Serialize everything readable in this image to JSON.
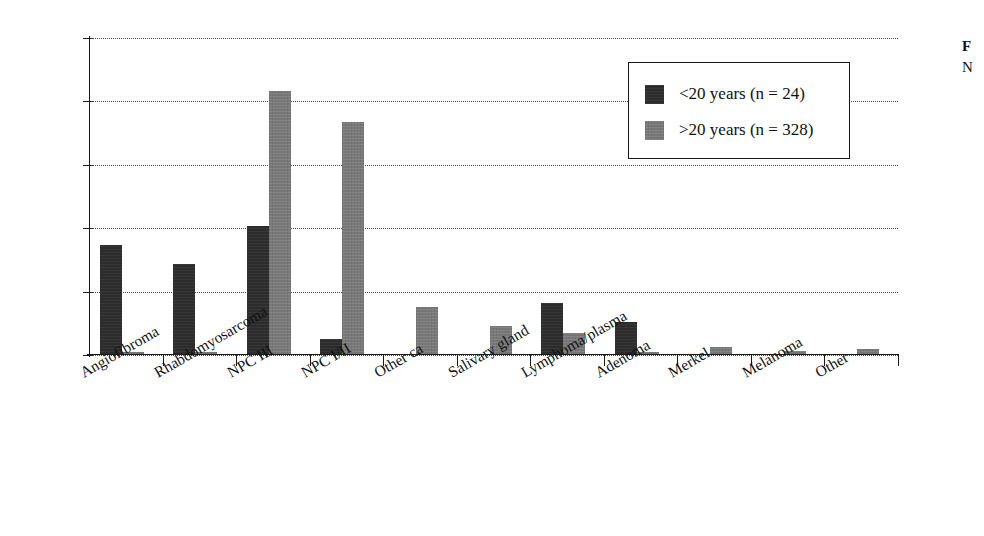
{
  "chart_data": {
    "type": "bar",
    "title": "",
    "xlabel": "",
    "ylabel": "",
    "ylim": [
      0,
      50
    ],
    "yunit": "%",
    "grid": true,
    "legend_position": "upper-right",
    "ytick_labels": [
      "0%",
      "10%",
      "20%",
      "30%",
      "40%",
      "50%"
    ],
    "ytick_values": [
      0,
      10,
      20,
      30,
      40,
      50
    ],
    "categories": [
      "Angiofibroma",
      "Rhabdomyosarcoma",
      "NPC III",
      "NPC I/II",
      "Other ca",
      "Salivary gland",
      "Lymphoma/plasma",
      "Adenoma",
      "Merkel",
      "Melanoma",
      "Other"
    ],
    "series": [
      {
        "name": "<20 years (n = 24)",
        "color": "#2c2c2c",
        "values": [
          17.4,
          14.3,
          20.3,
          2.5,
          0,
          0,
          8.2,
          5.2,
          0,
          0,
          0
        ]
      },
      {
        "name": ">20 years (n = 328)",
        "color": "#787878",
        "values": [
          0.4,
          0.4,
          41.7,
          36.7,
          7.5,
          4.5,
          3.5,
          0.5,
          1.3,
          0.6,
          0.9
        ]
      }
    ]
  },
  "legend": {
    "items": [
      {
        "label": "<20 years (n = 24)",
        "swatch": "dark"
      },
      {
        "label": ">20 years (n = 328)",
        "swatch": "gray"
      }
    ]
  },
  "caption": {
    "lead": "F",
    "second": "N"
  }
}
